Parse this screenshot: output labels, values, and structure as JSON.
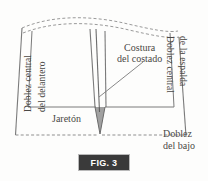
{
  "figure": {
    "caption": "FIG. 3",
    "type": "sewing-pattern-diagram",
    "language": "es"
  },
  "labels": {
    "left_fold_line1": "Doblez central",
    "left_fold_line2": "del delantero",
    "right_fold_line1": "Doblez central",
    "right_fold_line2": "de la espalda",
    "side_seam_line1": "Costura",
    "side_seam_line2": "del costado",
    "hem_allowance": "Jaretón",
    "bottom_fold_line1": "Doblez",
    "bottom_fold_line2": "del bajo"
  },
  "colors": {
    "background": "#fdfdfc",
    "line": "#6b6b6b",
    "dash": "#9a9a9a",
    "text": "#4a4845",
    "fig_box_fill": "#3a3a3a",
    "fig_box_border": "#b9b9b9",
    "fig_box_text": "#ffffff"
  }
}
